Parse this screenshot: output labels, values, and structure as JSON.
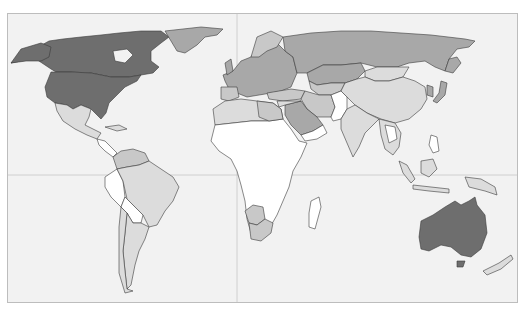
{
  "map": {
    "type": "choropleth world map",
    "projection": "equirectangular-like",
    "palette": {
      "ocean": "#f2f2f2",
      "frame_border": "#bdbdbd",
      "gridline": "#c6c6c6",
      "border": "#3a3a3a",
      "class_highest": "#6e6e6e",
      "class_high": "#a8a8a8",
      "class_mid": "#c8c8c8",
      "class_low": "#dcdcdc",
      "class_lowest": "#ffffff"
    },
    "gridlines": {
      "equator_y": 174,
      "prime_meridian_x": 236
    },
    "regions": [
      {
        "name": "Canada",
        "class": "class_highest"
      },
      {
        "name": "United States",
        "class": "class_highest"
      },
      {
        "name": "Australia",
        "class": "class_highest"
      },
      {
        "name": "Greenland",
        "class": "class_high"
      },
      {
        "name": "Russia",
        "class": "class_high"
      },
      {
        "name": "Kazakhstan",
        "class": "class_high"
      },
      {
        "name": "Saudi Arabia",
        "class": "class_high"
      },
      {
        "name": "Europe",
        "class": "class_high"
      },
      {
        "name": "Mexico",
        "class": "class_low"
      },
      {
        "name": "Brazil",
        "class": "class_low"
      },
      {
        "name": "Argentina",
        "class": "class_low"
      },
      {
        "name": "China",
        "class": "class_low"
      },
      {
        "name": "India",
        "class": "class_low"
      },
      {
        "name": "Mongolia",
        "class": "class_low"
      },
      {
        "name": "Iran",
        "class": "class_mid"
      },
      {
        "name": "South Africa",
        "class": "class_mid"
      },
      {
        "name": "Africa (most)",
        "class": "class_lowest"
      },
      {
        "name": "Peru",
        "class": "class_lowest"
      },
      {
        "name": "Indonesia",
        "class": "class_low"
      },
      {
        "name": "New Zealand",
        "class": "class_low"
      }
    ]
  }
}
